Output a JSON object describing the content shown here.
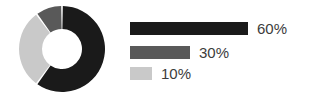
{
  "chart_data": {
    "type": "pie",
    "variant": "donut",
    "title": "",
    "xlabel": "",
    "ylabel": "",
    "categories": [
      "Series 1",
      "Series 2",
      "Series 3"
    ],
    "values": [
      60,
      30,
      10
    ],
    "value_unit": "%",
    "data_labels": [
      "60%",
      "30%",
      "10%"
    ],
    "colors": [
      "#1a1a1a",
      "#c9c9c9",
      "#595959"
    ],
    "slice_gap_color": "#ffffff",
    "start_angle_deg": 0,
    "direction": "clockwise",
    "legend": {
      "position": "right",
      "style": "proportional-bars",
      "entries": [
        {
          "label": "60%",
          "value": 60,
          "color": "#1a1a1a",
          "bar_width_px": 118
        },
        {
          "label": "30%",
          "value": 30,
          "color": "#595959",
          "bar_width_px": 60
        },
        {
          "label": "10%",
          "value": 10,
          "color": "#c9c9c9",
          "bar_width_px": 22
        }
      ]
    },
    "geometry": {
      "center_x": 62,
      "center_y": 49,
      "outer_radius": 43,
      "inner_radius": 20
    }
  }
}
